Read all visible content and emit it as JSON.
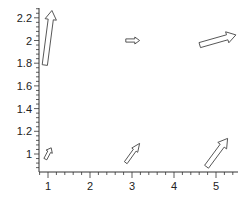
{
  "chart_data": {
    "type": "quiver",
    "title": "",
    "xlabel": "",
    "ylabel": "",
    "xlim": [
      0.8,
      5.5
    ],
    "ylim": [
      0.85,
      2.3
    ],
    "grid": false,
    "legend": null,
    "x_ticks": [
      1,
      2,
      3,
      4,
      5
    ],
    "x_tick_labels": [
      "1",
      "2",
      "3",
      "4",
      "5"
    ],
    "y_ticks": [
      1,
      1.2,
      1.4,
      1.6,
      1.8,
      2,
      2.2
    ],
    "y_tick_labels": [
      "1",
      "1.2",
      "1.4",
      "1.6",
      "1.8",
      "2",
      "2.2"
    ],
    "arrow_style": "hollow block arrows, dark outline, white fill",
    "arrows": [
      {
        "x": 1,
        "y": 1,
        "u": 0.14,
        "v": 0.1
      },
      {
        "x": 3,
        "y": 1,
        "u": 0.33,
        "v": 0.17
      },
      {
        "x": 5,
        "y": 1,
        "u": 0.5,
        "v": 0.25
      },
      {
        "x": 1,
        "y": 2,
        "u": 0.17,
        "v": 0.48
      },
      {
        "x": 3,
        "y": 2,
        "u": 0.33,
        "v": 0.0
      },
      {
        "x": 5,
        "y": 2,
        "u": 0.86,
        "v": 0.09
      }
    ]
  },
  "colors": {
    "axis": "#333333",
    "arrow_outline": "#444444",
    "arrow_fill": "#ffffff",
    "background": "#ffffff"
  }
}
